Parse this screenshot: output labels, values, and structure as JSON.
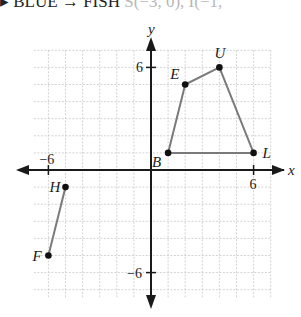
{
  "header": {
    "text_dark": "▸ BLUE → FISH",
    "text_faded": "S(−3, 0), I(−1,"
  },
  "chart_data": {
    "type": "scatter",
    "title": "",
    "xlabel": "x",
    "ylabel": "y",
    "xlim": [
      -7,
      7
    ],
    "ylim": [
      -7.5,
      7
    ],
    "grid": true,
    "tick_labels": {
      "x": [
        "-6",
        "6"
      ],
      "y": [
        "6",
        "-6"
      ]
    },
    "series": [
      {
        "name": "BLUE",
        "closed": true,
        "points": [
          {
            "label": "B",
            "x": 1,
            "y": 1
          },
          {
            "label": "E",
            "x": 2,
            "y": 5
          },
          {
            "label": "U",
            "x": 4,
            "y": 6
          },
          {
            "label": "L",
            "x": 6,
            "y": 1
          }
        ]
      },
      {
        "name": "FH",
        "closed": false,
        "points": [
          {
            "label": "H",
            "x": -5,
            "y": -1
          },
          {
            "label": "F",
            "x": -6,
            "y": -5
          }
        ]
      }
    ],
    "colors": {
      "axis": "#1a1a1a",
      "grid": "#c8c8c8",
      "segment": "#7a7a7a",
      "point": "#111111"
    }
  }
}
